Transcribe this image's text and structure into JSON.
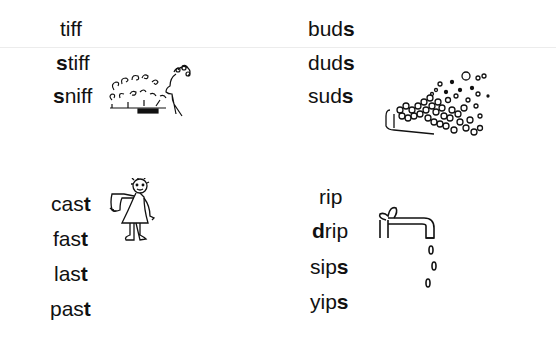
{
  "groups": [
    {
      "name": "tiff-family",
      "words": [
        {
          "pre": "",
          "bold": "",
          "post": "tiff",
          "full": "tiff"
        },
        {
          "pre": "",
          "bold": "s",
          "post": "tiff",
          "full": "stiff"
        },
        {
          "pre": "",
          "bold": "s",
          "post": "niff",
          "full": "sniff"
        }
      ],
      "illustration": "person-sniffing-flowers"
    },
    {
      "name": "uds-family",
      "words": [
        {
          "pre": "bud",
          "bold": "s",
          "post": "",
          "full": "buds"
        },
        {
          "pre": "dud",
          "bold": "s",
          "post": "",
          "full": "duds"
        },
        {
          "pre": "sud",
          "bold": "s",
          "post": "",
          "full": "suds"
        }
      ],
      "illustration": "soap-suds-tub"
    },
    {
      "name": "ast-family",
      "words": [
        {
          "pre": "cas",
          "bold": "t",
          "post": "",
          "full": "cast"
        },
        {
          "pre": "fas",
          "bold": "t",
          "post": "",
          "full": "fast"
        },
        {
          "pre": "las",
          "bold": "t",
          "post": "",
          "full": "last"
        },
        {
          "pre": "pas",
          "bold": "t",
          "post": "",
          "full": "past"
        }
      ],
      "illustration": "girl-with-arm-cast"
    },
    {
      "name": "ip-family",
      "words": [
        {
          "pre": "",
          "bold": "",
          "post": "rip",
          "full": "rip"
        },
        {
          "pre": "",
          "bold": "d",
          "post": "rip",
          "full": "drip"
        },
        {
          "pre": "sip",
          "bold": "s",
          "post": "",
          "full": "sips"
        },
        {
          "pre": "yip",
          "bold": "s",
          "post": "",
          "full": "yips"
        }
      ],
      "illustration": "dripping-faucet"
    }
  ]
}
